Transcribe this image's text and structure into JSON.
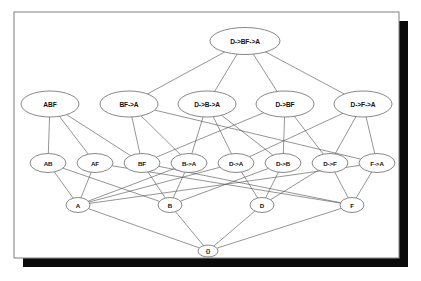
{
  "figure": {
    "kind": "hasse-lattice-diagram",
    "background_color": "#ffffff",
    "frame_stroke_color": "#8a8a8a",
    "shadow_color": "#0a0a0a",
    "node_fill_color": "#ffffff",
    "node_stroke_color": "#555555",
    "edge_color": "#5b5b5b",
    "label_color": "#111111"
  },
  "nodes": [
    {
      "id": "top",
      "label": "D->BF->A",
      "cx": 245,
      "cy": 41,
      "rx": 35,
      "ry": 13.5,
      "font_size": 6.6
    },
    {
      "id": "abf",
      "label": "ABF",
      "cx": 50,
      "cy": 104,
      "rx": 29,
      "ry": 13,
      "font_size": 6.6
    },
    {
      "id": "bf_a",
      "label": "BF->A",
      "cx": 129,
      "cy": 104,
      "rx": 29,
      "ry": 13,
      "font_size": 6.6
    },
    {
      "id": "d_b_a",
      "label": "D->B->A",
      "cx": 207,
      "cy": 104,
      "rx": 29,
      "ry": 13,
      "font_size": 6.6
    },
    {
      "id": "d_bf",
      "label": "D->BF",
      "cx": 285,
      "cy": 104,
      "rx": 29,
      "ry": 13,
      "font_size": 6.6
    },
    {
      "id": "d_f_a",
      "label": "D->F->A",
      "cx": 363,
      "cy": 104,
      "rx": 29,
      "ry": 13,
      "font_size": 6.6
    },
    {
      "id": "ab",
      "label": "AB",
      "cx": 48,
      "cy": 163,
      "rx": 18,
      "ry": 9.5,
      "font_size": 6.2
    },
    {
      "id": "af",
      "label": "AF",
      "cx": 95,
      "cy": 163,
      "rx": 18,
      "ry": 9.5,
      "font_size": 6.2
    },
    {
      "id": "bf",
      "label": "BF",
      "cx": 142,
      "cy": 163,
      "rx": 18,
      "ry": 9.5,
      "font_size": 6.2
    },
    {
      "id": "b_a",
      "label": "B->A",
      "cx": 189,
      "cy": 163,
      "rx": 18,
      "ry": 9.5,
      "font_size": 6.2
    },
    {
      "id": "d_a",
      "label": "D->A",
      "cx": 236,
      "cy": 163,
      "rx": 18,
      "ry": 9.5,
      "font_size": 6.2
    },
    {
      "id": "d_b",
      "label": "D->B",
      "cx": 283,
      "cy": 163,
      "rx": 18,
      "ry": 9.5,
      "font_size": 6.2
    },
    {
      "id": "d_f",
      "label": "D->F",
      "cx": 330,
      "cy": 163,
      "rx": 18,
      "ry": 9.5,
      "font_size": 6.2
    },
    {
      "id": "f_a",
      "label": "F->A",
      "cx": 377,
      "cy": 163,
      "rx": 18,
      "ry": 9.5,
      "font_size": 6.2
    },
    {
      "id": "a",
      "label": "A",
      "cx": 78,
      "cy": 205,
      "rx": 12,
      "ry": 7.5,
      "font_size": 6.2
    },
    {
      "id": "b",
      "label": "B",
      "cx": 170,
      "cy": 205,
      "rx": 12,
      "ry": 7.5,
      "font_size": 6.2
    },
    {
      "id": "d",
      "label": "D",
      "cx": 262,
      "cy": 205,
      "rx": 12,
      "ry": 7.5,
      "font_size": 6.2
    },
    {
      "id": "f",
      "label": "F",
      "cx": 352,
      "cy": 205,
      "rx": 12,
      "ry": 7.5,
      "font_size": 6.2
    },
    {
      "id": "empty",
      "label": "{}",
      "cx": 208,
      "cy": 251,
      "rx": 10,
      "ry": 6,
      "font_size": 6.0
    }
  ],
  "edges": [
    {
      "from": "top",
      "to": "bf_a"
    },
    {
      "from": "top",
      "to": "d_b_a"
    },
    {
      "from": "top",
      "to": "d_bf"
    },
    {
      "from": "top",
      "to": "d_f_a"
    },
    {
      "from": "abf",
      "to": "ab"
    },
    {
      "from": "abf",
      "to": "af"
    },
    {
      "from": "abf",
      "to": "bf"
    },
    {
      "from": "bf_a",
      "to": "bf"
    },
    {
      "from": "bf_a",
      "to": "b_a"
    },
    {
      "from": "bf_a",
      "to": "f_a"
    },
    {
      "from": "d_b_a",
      "to": "b_a"
    },
    {
      "from": "d_b_a",
      "to": "d_a"
    },
    {
      "from": "d_b_a",
      "to": "d_b"
    },
    {
      "from": "d_bf",
      "to": "d_b"
    },
    {
      "from": "d_bf",
      "to": "d_f"
    },
    {
      "from": "d_bf",
      "to": "bf"
    },
    {
      "from": "d_f_a",
      "to": "d_a"
    },
    {
      "from": "d_f_a",
      "to": "d_f"
    },
    {
      "from": "d_f_a",
      "to": "f_a"
    },
    {
      "from": "ab",
      "to": "a"
    },
    {
      "from": "ab",
      "to": "b"
    },
    {
      "from": "af",
      "to": "a"
    },
    {
      "from": "af",
      "to": "f"
    },
    {
      "from": "bf",
      "to": "b"
    },
    {
      "from": "bf",
      "to": "f"
    },
    {
      "from": "b_a",
      "to": "a"
    },
    {
      "from": "b_a",
      "to": "b"
    },
    {
      "from": "d_a",
      "to": "a"
    },
    {
      "from": "d_a",
      "to": "d"
    },
    {
      "from": "d_b",
      "to": "b"
    },
    {
      "from": "d_b",
      "to": "d"
    },
    {
      "from": "d_f",
      "to": "d"
    },
    {
      "from": "d_f",
      "to": "f"
    },
    {
      "from": "f_a",
      "to": "a"
    },
    {
      "from": "f_a",
      "to": "f"
    },
    {
      "from": "a",
      "to": "empty"
    },
    {
      "from": "b",
      "to": "empty"
    },
    {
      "from": "d",
      "to": "empty"
    },
    {
      "from": "f",
      "to": "empty"
    }
  ],
  "frame": {
    "x": 14,
    "y": 12,
    "width": 385,
    "height": 246,
    "shadow_offset": 9
  }
}
